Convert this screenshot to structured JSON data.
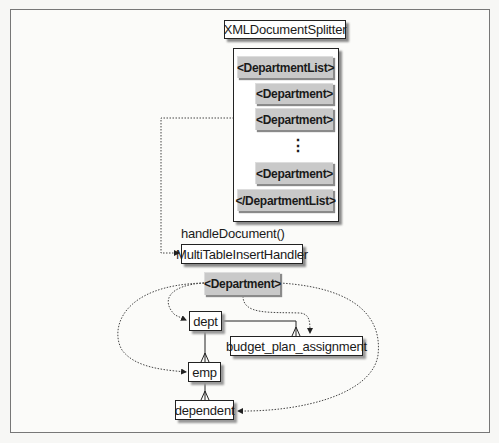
{
  "diagram": {
    "splitter": {
      "label": "XMLDocumentSplitter"
    },
    "document_elements": [
      {
        "label": "<DepartmentList>"
      },
      {
        "label": "<Department>"
      },
      {
        "label": "<Department>"
      },
      {
        "label": "<Department>"
      },
      {
        "label": "</DepartmentList>"
      }
    ],
    "ellipsis": "⋮",
    "method_label": "handleDocument()",
    "handler": {
      "label": "MultiTableInsertHandler"
    },
    "current_element": {
      "label": "<Department>"
    },
    "tables": {
      "dept": "dept",
      "budget": "budget_plan_assignment",
      "emp": "emp",
      "dependent": "dependent"
    }
  }
}
